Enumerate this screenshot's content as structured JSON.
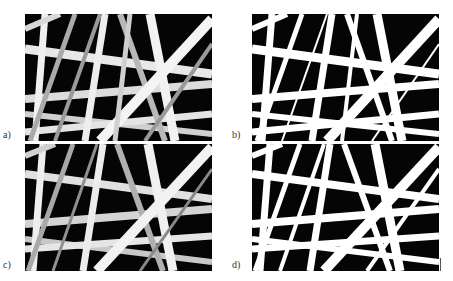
{
  "figure": {
    "panels": [
      {
        "id": "a",
        "label": "a)",
        "style": "grayscale-sem"
      },
      {
        "id": "b",
        "label": "b)",
        "style": "binarized"
      },
      {
        "id": "c",
        "label": "c)",
        "style": "grayscale-sem"
      },
      {
        "id": "d",
        "label": "d)",
        "style": "binarized"
      }
    ]
  }
}
